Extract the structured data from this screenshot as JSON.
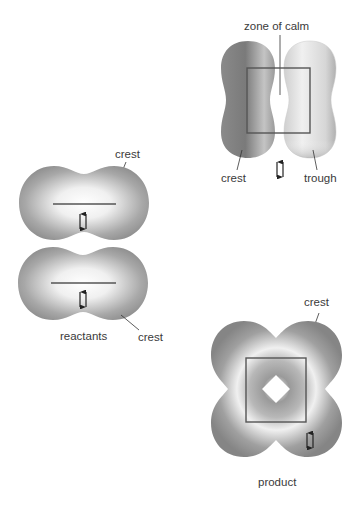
{
  "diagram": {
    "panels": {
      "reactants": {
        "caption": "reactants",
        "top_label": "crest",
        "bottom_label": "crest",
        "shape_color": "#8f8f8f",
        "highlight_color": "#f2f2f2"
      },
      "transition": {
        "top_label": "zone of calm",
        "left_label": "crest",
        "right_label": "trough",
        "crest_color": "#7d7d7d",
        "trough_color": "#b5b5b5"
      },
      "product": {
        "caption": "product",
        "label": "crest",
        "shape_color": "#8a8a8a"
      }
    },
    "spin_pair_symbol": "↑↓"
  }
}
